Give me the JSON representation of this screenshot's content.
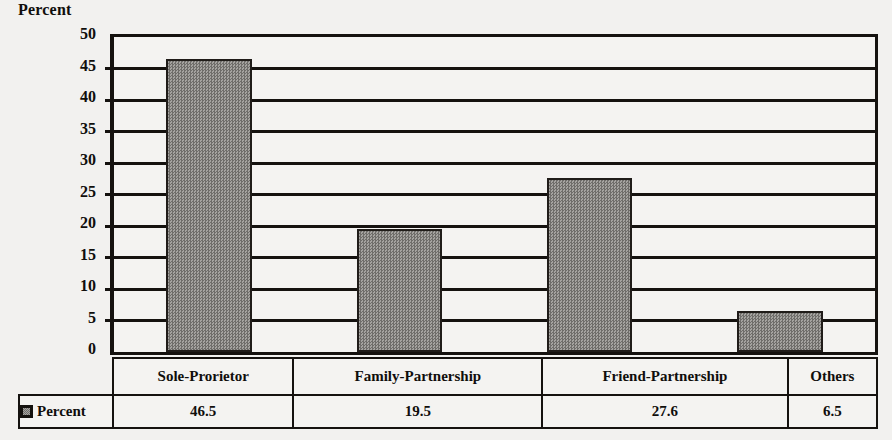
{
  "chart_data": {
    "type": "bar",
    "title": "",
    "ylabel": "Percent",
    "xlabel": "",
    "categories": [
      "Sole-Prorietor",
      "Family-Partnership",
      "Friend-Partnership",
      "Others"
    ],
    "values": [
      46.5,
      19.5,
      27.6,
      6.5
    ],
    "series": [
      {
        "name": "Percent",
        "values": [
          46.5,
          19.5,
          27.6,
          6.5
        ]
      }
    ],
    "ylim": [
      0,
      50
    ],
    "ytick_step": 5,
    "ytick_labels": [
      "50",
      "45",
      "40",
      "35",
      "30",
      "25",
      "20",
      "15",
      "10",
      "5",
      "0"
    ],
    "grid": true,
    "legend_position": "bottom-table",
    "legend_entries": [
      "Percent"
    ],
    "data_table": {
      "row_label": "Percent",
      "columns": [
        "Sole-Prorietor",
        "Family-Partnership",
        "Friend-Partnership",
        "Others"
      ],
      "values": [
        "46.5",
        "19.5",
        "27.6",
        "6.5"
      ]
    },
    "colors": {
      "bar_fill": "#8d8b88",
      "bar_border": "#201c19",
      "gridline": "#15120f",
      "text": "#100e0c",
      "background": "#f2f1ef"
    },
    "icons": {
      "legend_swatch": "legend-swatch-icon"
    }
  }
}
